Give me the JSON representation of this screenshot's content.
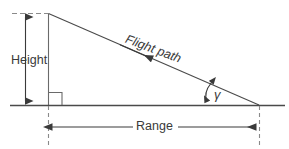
{
  "diagram": {
    "labels": {
      "height": "Height",
      "flight_path": "Flight path",
      "range": "Range",
      "gamma": "γ"
    },
    "colors": {
      "line": "#3a3a3a",
      "ground": "#4a4a4a",
      "dashed": "#8a8a8a",
      "text": "#3a3a3a",
      "background": "#ffffff"
    },
    "geometry": {
      "apex_x": 48,
      "apex_y": 13,
      "ground_y": 105,
      "ground_left_x": 10,
      "ground_right_x": 285,
      "touchdown_x": 259,
      "range_line_y": 127,
      "height_arrow_x": 25,
      "right_angle_size": 13,
      "flight_path_angle_deg": 20.5
    }
  }
}
